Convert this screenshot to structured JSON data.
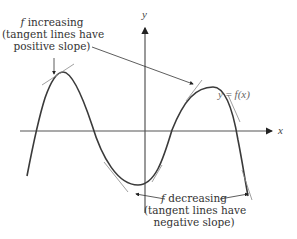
{
  "diagram": {
    "axes": {
      "x_label": "x",
      "y_label": "y"
    },
    "curve_label": {
      "lhs": "y",
      "eq": " = ",
      "rhs": "f(x)"
    },
    "annotation_increasing": {
      "f": "f",
      "line1": " increasing",
      "line2": "(tangent lines have",
      "line3": "positive slope)"
    },
    "annotation_decreasing": {
      "f": "f",
      "line1": " decreasing",
      "line2": "(tangent lines have",
      "line3": "negative slope)"
    },
    "colors": {
      "curve": "#3a3a3a",
      "axis": "#555555",
      "tangent": "#888888",
      "arrow": "#333333"
    }
  }
}
